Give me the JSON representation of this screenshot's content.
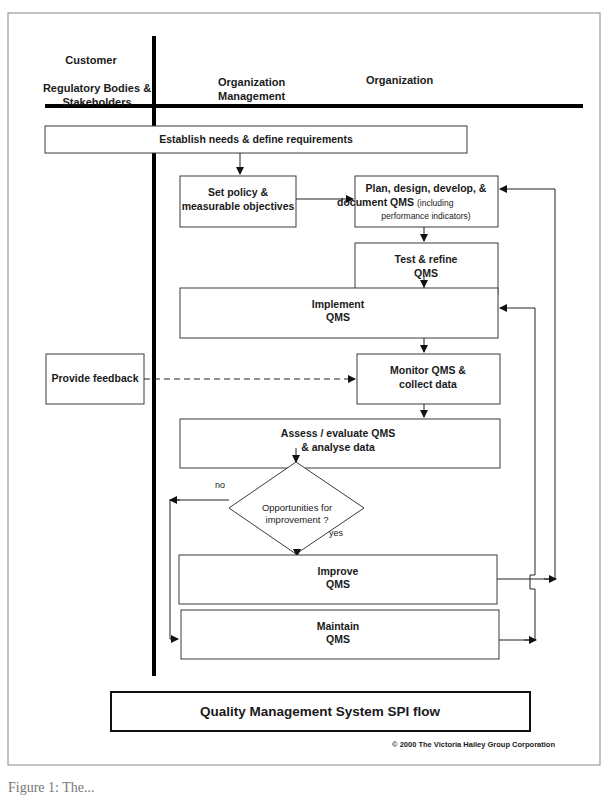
{
  "lanes": {
    "customer_title": "Customer",
    "customer_subtitle_line1": "Regulatory Bodies &",
    "customer_subtitle_line2": "Stakeholders",
    "mgmt_line1": "Organization",
    "mgmt_line2": "Management",
    "org": "Organization"
  },
  "nodes": {
    "establish": "Establish needs & define requirements",
    "policy_line1": "Set policy &",
    "policy_line2": "measurable objectives",
    "plan_line1": "Plan, design, develop, &",
    "plan_line2_bold": "document QMS",
    "plan_line2_small": "(including",
    "plan_line3": "performance indicators)",
    "test_line1": "Test & refine",
    "test_line2": "QMS",
    "implement_line1": "Implement",
    "implement_line2": "QMS",
    "feedback": "Provide feedback",
    "monitor_line1": "Monitor QMS &",
    "monitor_line2": "collect data",
    "assess_line1": "Assess / evaluate QMS",
    "assess_line2": "& analyse data",
    "decision_line1": "Opportunities for",
    "decision_line2": "improvement ?",
    "no_label": "no",
    "yes_label": "yes",
    "improve_line1": "Improve",
    "improve_line2": "QMS",
    "maintain_line1": "Maintain",
    "maintain_line2": "QMS"
  },
  "footer": {
    "title": "Quality Management System SPI flow",
    "copyright": "© 2000 The Victoria Hailey Group Corporation",
    "caption_partial": "Figure 1: The..."
  }
}
